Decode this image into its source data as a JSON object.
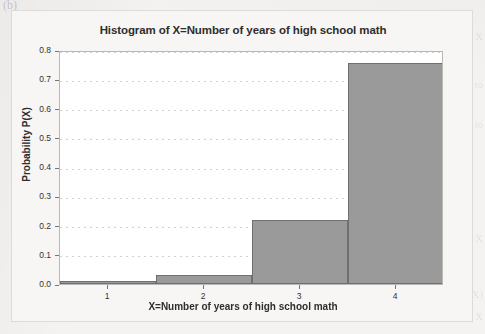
{
  "figure": {
    "corner_mark": "(b)",
    "background_color": "#f4f3f1",
    "panel_color": "#f7f6f4",
    "plot_background": "#ffffff"
  },
  "ghost_text": {
    "line1": "X",
    "line2": "ion to",
    "line3": "on lo",
    "line4": "X",
    "line5": "(X)",
    "line6": "u that X"
  },
  "chart_data": {
    "type": "bar",
    "title": "Histogram of X=Number of years of high school math",
    "xlabel": "X=Number of years of high school math",
    "ylabel": "Probability P(X)",
    "categories": [
      "1",
      "2",
      "3",
      "4"
    ],
    "values": [
      0.01,
      0.03,
      0.22,
      0.755
    ],
    "ylim": [
      0.0,
      0.8
    ],
    "ytick_values": [
      "0.0",
      "0.1",
      "0.2",
      "0.3",
      "0.4",
      "0.5",
      "0.6",
      "0.7",
      "0.8"
    ],
    "xtick_labels": [
      "1",
      "2",
      "3",
      "4"
    ],
    "grid": true,
    "grid_axis": "y",
    "legend": false,
    "bar_fill_color": "#9a9a9a",
    "bar_edge_color": "#6f6f6f",
    "bar_width_fraction": 1.0
  }
}
